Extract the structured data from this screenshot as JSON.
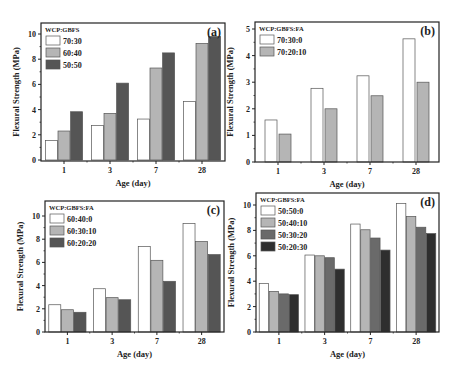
{
  "figure": {
    "panels": [
      {
        "id": "a",
        "label": "(a)"
      },
      {
        "id": "b",
        "label": "(b)"
      },
      {
        "id": "c",
        "label": "(c)"
      },
      {
        "id": "d",
        "label": "(d)"
      }
    ]
  },
  "chart_data": [
    {
      "type": "bar",
      "panel_label": "(a)",
      "title": "",
      "xlabel": "Age (day)",
      "ylabel": "Flexural Strength (MPa)",
      "categories": [
        "1",
        "3",
        "7",
        "28"
      ],
      "ylim": [
        0,
        11
      ],
      "yticks": [
        0,
        2,
        4,
        6,
        8,
        10
      ],
      "legend_title": "WCP:GBFS",
      "legend_position": "upper left",
      "grid": false,
      "series": [
        {
          "name": "70:30",
          "color": "#ffffff",
          "values": [
            1.55,
            2.75,
            3.25,
            4.65
          ]
        },
        {
          "name": "60:40",
          "color": "#b5b5b5",
          "values": [
            2.3,
            3.7,
            7.3,
            9.25
          ]
        },
        {
          "name": "50:50",
          "color": "#555555",
          "values": [
            3.83,
            6.1,
            8.5,
            9.8
          ]
        }
      ],
      "frame": {
        "left": 41,
        "top": 23,
        "right": 225,
        "bottom": 161,
        "zero_y": 160,
        "unit_px": 12.6
      }
    },
    {
      "type": "bar",
      "panel_label": "(b)",
      "title": "",
      "xlabel": "Age (day)",
      "ylabel": "Flexural Strength (MPa)",
      "categories": [
        "1",
        "3",
        "7",
        "28"
      ],
      "ylim": [
        0,
        5.2
      ],
      "yticks": [
        0,
        1,
        2,
        3,
        4,
        5
      ],
      "legend_title": "WCP:GBFS:FA",
      "legend_position": "upper left",
      "grid": false,
      "series": [
        {
          "name": "70:30:0",
          "color": "#ffffff",
          "values": [
            1.58,
            2.77,
            3.24,
            4.63
          ]
        },
        {
          "name": "70:20:10",
          "color": "#b5b5b5",
          "values": [
            1.05,
            2.0,
            2.49,
            3.0
          ]
        }
      ],
      "frame": {
        "left": 255,
        "top": 22,
        "right": 439,
        "bottom": 162,
        "zero_y": 162,
        "unit_px": 26.6
      }
    },
    {
      "type": "bar",
      "panel_label": "(c)",
      "title": "",
      "xlabel": "Age (day)",
      "ylabel": "Flexural Strength (MPa)",
      "categories": [
        "1",
        "3",
        "7",
        "28"
      ],
      "ylim": [
        0,
        11.3
      ],
      "yticks": [
        0,
        2,
        4,
        6,
        8,
        10
      ],
      "legend_title": "WCP:GBFS:FA",
      "legend_position": "upper left",
      "grid": false,
      "series": [
        {
          "name": "60:40:0",
          "color": "#ffffff",
          "values": [
            2.35,
            3.73,
            7.38,
            9.35
          ]
        },
        {
          "name": "60:30:10",
          "color": "#b5b5b5",
          "values": [
            1.92,
            2.96,
            6.18,
            7.8
          ]
        },
        {
          "name": "60:20:20",
          "color": "#555555",
          "values": [
            1.7,
            2.78,
            4.37,
            6.67
          ]
        }
      ],
      "frame": {
        "left": 45,
        "top": 201,
        "right": 224,
        "bottom": 332,
        "zero_y": 332,
        "unit_px": 11.6
      }
    },
    {
      "type": "bar",
      "panel_label": "(d)",
      "title": "",
      "xlabel": "Age (day)",
      "ylabel": "Flexural Strength (MPa)",
      "categories": [
        "1",
        "3",
        "7",
        "28"
      ],
      "ylim": [
        0,
        10.9
      ],
      "yticks": [
        0,
        2,
        4,
        6,
        8,
        10
      ],
      "legend_title": "WCP:GBFS:FA",
      "legend_position": "upper left",
      "grid": false,
      "series": [
        {
          "name": "50:50:0",
          "color": "#ffffff",
          "values": [
            3.83,
            6.06,
            8.5,
            10.13
          ]
        },
        {
          "name": "50:40:10",
          "color": "#b5b5b5",
          "values": [
            3.2,
            6.0,
            8.05,
            9.1
          ]
        },
        {
          "name": "50:30:20",
          "color": "#6a6a6a",
          "values": [
            3.0,
            5.85,
            7.4,
            8.25
          ]
        },
        {
          "name": "50:20:30",
          "color": "#2e2e2e",
          "values": [
            2.94,
            4.95,
            6.45,
            7.75
          ]
        }
      ],
      "frame": {
        "left": 256,
        "top": 193,
        "right": 439,
        "bottom": 332,
        "zero_y": 332,
        "unit_px": 12.7
      }
    }
  ]
}
